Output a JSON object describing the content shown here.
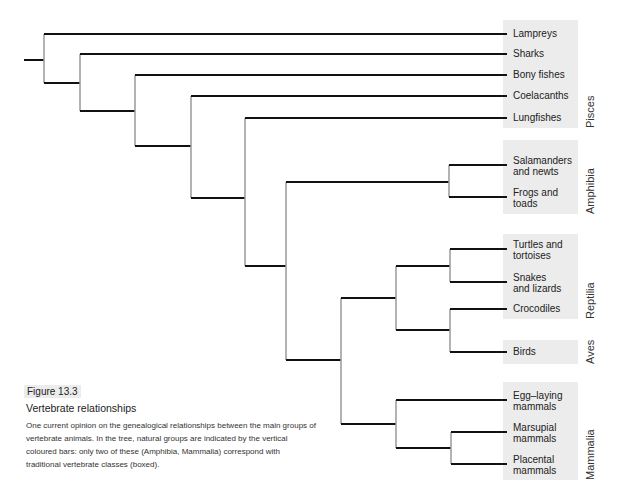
{
  "figure": {
    "tag": "Figure 13.3",
    "title": "Vertebrate relationships",
    "caption": "One current opinion on the genealogical relationships between the main groups of vertebrate animals. In the tree, natural groups are indicated by the vertical coloured bars: only two of these (Amphibia, Mammalia) correspond with traditional vertebrate classes (boxed)."
  },
  "taxa": [
    {
      "lines": [
        "Lampreys"
      ],
      "y": 34
    },
    {
      "lines": [
        "Sharks"
      ],
      "y": 54
    },
    {
      "lines": [
        "Bony fishes"
      ],
      "y": 75
    },
    {
      "lines": [
        "Coelacanths"
      ],
      "y": 96
    },
    {
      "lines": [
        "Lungfishes"
      ],
      "y": 118
    },
    {
      "lines": [
        "Salamanders",
        "and newts"
      ],
      "y": 165
    },
    {
      "lines": [
        "Frogs and",
        "toads"
      ],
      "y": 197
    },
    {
      "lines": [
        "Turtles and",
        "tortoises"
      ],
      "y": 249
    },
    {
      "lines": [
        "Snakes",
        "and lizards"
      ],
      "y": 282
    },
    {
      "lines": [
        "Crocodiles"
      ],
      "y": 309
    },
    {
      "lines": [
        "Birds"
      ],
      "y": 352
    },
    {
      "lines": [
        "Egg–laying",
        "mammals"
      ],
      "y": 400
    },
    {
      "lines": [
        "Marsupial",
        "mammals"
      ],
      "y": 432
    },
    {
      "lines": [
        "Placental",
        "mammals"
      ],
      "y": 464
    }
  ],
  "groups": [
    {
      "name": "Pisces",
      "top": 20,
      "bottom": 128
    },
    {
      "name": "Amphibia",
      "top": 140,
      "bottom": 214
    },
    {
      "name": "Reptilia",
      "top": 234,
      "bottom": 319
    },
    {
      "name": "Aves",
      "top": 340,
      "bottom": 364
    },
    {
      "name": "Mammalia",
      "top": 382,
      "bottom": 480
    }
  ],
  "colors": {
    "branch_horizontal": "#111111",
    "branch_vertical": "#9a9a9a",
    "group_box": "#ececec"
  }
}
